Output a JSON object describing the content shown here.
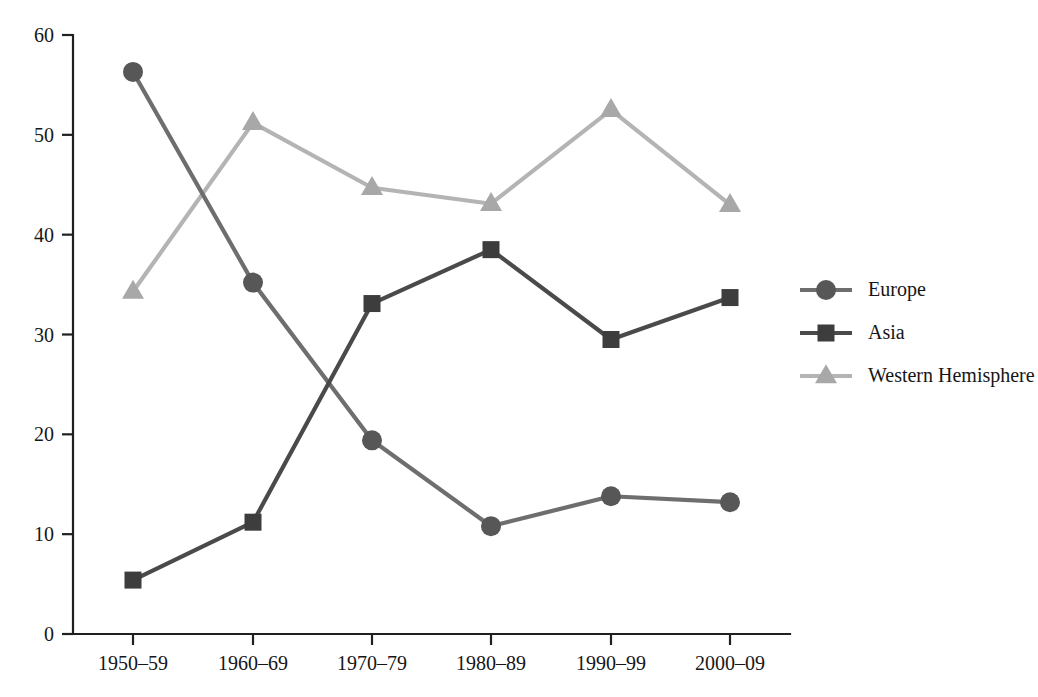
{
  "chart_data": {
    "type": "line",
    "title": "",
    "subtitle": "",
    "xlabel": "",
    "ylabel": "",
    "categories": [
      "1950–59",
      "1960–69",
      "1970–79",
      "1980–89",
      "1990–99",
      "2000–09"
    ],
    "ylim": [
      0,
      60
    ],
    "yticks": [
      0,
      10,
      20,
      30,
      40,
      50,
      60
    ],
    "ytick_labels": [
      "0",
      "10",
      "20",
      "30",
      "40",
      "50",
      "60"
    ],
    "grid": false,
    "legend_position": "right",
    "series": [
      {
        "name": "Europe",
        "marker": "circle",
        "color": "#6e6e6e",
        "marker_color": "#575757",
        "values": [
          56.3,
          35.2,
          19.4,
          10.8,
          13.8,
          13.2
        ]
      },
      {
        "name": "Asia",
        "marker": "square",
        "color": "#4a4a4a",
        "marker_color": "#3d3d3d",
        "values": [
          5.4,
          11.2,
          33.1,
          38.5,
          29.5,
          33.7
        ]
      },
      {
        "name": "Western Hemisphere",
        "marker": "triangle",
        "color": "#b4b4b4",
        "marker_color": "#a8a8a8",
        "values": [
          34.3,
          51.2,
          44.7,
          43.1,
          52.5,
          43.0
        ]
      }
    ]
  },
  "legend": {
    "entries": [
      {
        "label": "Europe"
      },
      {
        "label": "Asia"
      },
      {
        "label": "Western Hemisphere"
      }
    ]
  },
  "colors": {
    "axis": "#202020",
    "text": "#161616",
    "background": "#ffffff",
    "europe": "#6e6e6e",
    "asia": "#4a4a4a",
    "western_hemisphere": "#b4b4b4"
  }
}
